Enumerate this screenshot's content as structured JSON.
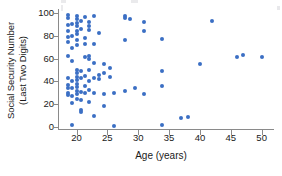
{
  "chart_data": {
    "type": "scatter",
    "title": "",
    "xlabel": "Age (years)",
    "ylabel_line1": "Social Security Number",
    "ylabel_line2": "(Last Two Digits)",
    "xlim": [
      17.0,
      52.0
    ],
    "ylim": [
      -4,
      104
    ],
    "xticks": [
      20,
      25,
      30,
      35,
      40,
      45,
      50
    ],
    "yticks": [
      0,
      20,
      40,
      60,
      80,
      100
    ],
    "grid": false,
    "legend": null,
    "marker_color": "#3b6fc4",
    "axis_color": "#8a8a8a",
    "points": [
      [
        18.6,
        98
      ],
      [
        18.6,
        95
      ],
      [
        18.6,
        89
      ],
      [
        18.6,
        84
      ],
      [
        18.6,
        79
      ],
      [
        18.6,
        74
      ],
      [
        18.6,
        62
      ],
      [
        18.6,
        43
      ],
      [
        18.6,
        37
      ],
      [
        18.6,
        34
      ],
      [
        18.6,
        30
      ],
      [
        18.6,
        28
      ],
      [
        19.3,
        90
      ],
      [
        19.3,
        80
      ],
      [
        19.3,
        69
      ],
      [
        19.3,
        58
      ],
      [
        19.3,
        40
      ],
      [
        19.3,
        34
      ],
      [
        19.3,
        27
      ],
      [
        19.3,
        21
      ],
      [
        19.3,
        2
      ],
      [
        20.0,
        97
      ],
      [
        20.0,
        94
      ],
      [
        20.0,
        91
      ],
      [
        20.0,
        88
      ],
      [
        20.0,
        84
      ],
      [
        20.0,
        81
      ],
      [
        20.0,
        76
      ],
      [
        20.0,
        72
      ],
      [
        20.0,
        50
      ],
      [
        20.0,
        47
      ],
      [
        20.0,
        44
      ],
      [
        20.0,
        41
      ],
      [
        20.0,
        38
      ],
      [
        20.0,
        35
      ],
      [
        20.0,
        32
      ],
      [
        20.0,
        29
      ],
      [
        20.0,
        25
      ],
      [
        20.7,
        93
      ],
      [
        20.7,
        86
      ],
      [
        20.7,
        49
      ],
      [
        20.7,
        43
      ],
      [
        20.7,
        31
      ],
      [
        20.7,
        24
      ],
      [
        20.7,
        15
      ],
      [
        20.7,
        13
      ],
      [
        21.4,
        96
      ],
      [
        21.4,
        78
      ],
      [
        21.4,
        73
      ],
      [
        21.4,
        61
      ],
      [
        21.4,
        45
      ],
      [
        21.4,
        36
      ],
      [
        21.4,
        30
      ],
      [
        22.0,
        92
      ],
      [
        22.0,
        88
      ],
      [
        22.0,
        85
      ],
      [
        22.0,
        62
      ],
      [
        22.0,
        60
      ],
      [
        22.0,
        50
      ],
      [
        22.0,
        40
      ],
      [
        22.0,
        33
      ],
      [
        22.0,
        22
      ],
      [
        22.8,
        97
      ],
      [
        22.8,
        73
      ],
      [
        22.8,
        56
      ],
      [
        22.8,
        43
      ],
      [
        22.8,
        30
      ],
      [
        22.8,
        10
      ],
      [
        23.6,
        82
      ],
      [
        23.6,
        46
      ],
      [
        23.6,
        42
      ],
      [
        24.5,
        55
      ],
      [
        24.5,
        47
      ],
      [
        24.5,
        29
      ],
      [
        24.5,
        19
      ],
      [
        25.4,
        52
      ],
      [
        25.4,
        44
      ],
      [
        26.1,
        30
      ],
      [
        26.1,
        1
      ],
      [
        27.9,
        97
      ],
      [
        27.9,
        95
      ],
      [
        27.9,
        76
      ],
      [
        27.9,
        32
      ],
      [
        28.7,
        94
      ],
      [
        29.5,
        34
      ],
      [
        30.9,
        92
      ],
      [
        30.9,
        84
      ],
      [
        30.9,
        29
      ],
      [
        33.8,
        77
      ],
      [
        33.8,
        49
      ],
      [
        33.8,
        36
      ],
      [
        33.8,
        2
      ],
      [
        37.0,
        8
      ],
      [
        38.0,
        9
      ],
      [
        40.0,
        55
      ],
      [
        42.0,
        93
      ],
      [
        46.0,
        61
      ],
      [
        47.0,
        63
      ],
      [
        50.0,
        61
      ]
    ]
  }
}
